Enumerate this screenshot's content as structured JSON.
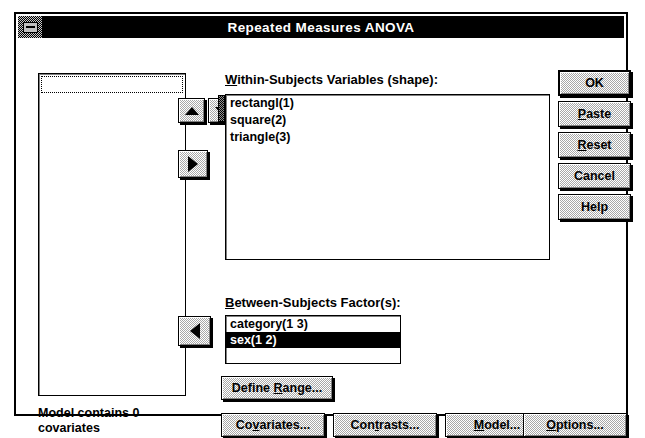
{
  "window": {
    "title": "Repeated Measures ANOVA",
    "sysmenu_icon": "system-menu-icon"
  },
  "source_list": {
    "items": [],
    "focus_row_present": true
  },
  "within_subjects": {
    "label": "Within-Subjects Variables   (shape):",
    "label_prefix": "W",
    "label_rest": "ithin-Subjects Variables   (shape):",
    "items": [
      "rectangl(1)",
      "square(2)",
      "triangle(3)"
    ]
  },
  "between_subjects": {
    "label_prefix": "B",
    "label_rest": "etween-Subjects Factor(s):",
    "items": [
      {
        "text": "category(1 3)",
        "selected": false
      },
      {
        "text": "sex(1 2)",
        "selected": true
      }
    ]
  },
  "transfer_buttons": {
    "up": "up-arrow",
    "down": "down-arrow",
    "move_right": "right-arrow",
    "move_left": "left-arrow"
  },
  "define_range_button": {
    "prefix": "Define ",
    "accel": "R",
    "suffix": "ange..."
  },
  "action_buttons": [
    {
      "name": "ok-button",
      "prefix": "",
      "accel": "",
      "suffix": "OK",
      "default": true
    },
    {
      "name": "paste-button",
      "prefix": "",
      "accel": "P",
      "suffix": "aste",
      "default": false
    },
    {
      "name": "reset-button",
      "prefix": "",
      "accel": "R",
      "suffix": "eset",
      "default": false
    },
    {
      "name": "cancel-button",
      "prefix": "",
      "accel": "",
      "suffix": "Cancel",
      "default": false
    },
    {
      "name": "help-button",
      "prefix": "",
      "accel": "",
      "suffix": "Help",
      "default": false
    }
  ],
  "bottom_buttons": [
    {
      "name": "covariates-button",
      "prefix": "Co",
      "accel": "v",
      "suffix": "ariates..."
    },
    {
      "name": "contrasts-button",
      "prefix": "Con",
      "accel": "t",
      "suffix": "rasts..."
    },
    {
      "name": "model-button",
      "prefix": "",
      "accel": "M",
      "suffix": "odel..."
    },
    {
      "name": "options-button",
      "prefix": "",
      "accel": "O",
      "suffix": "ptions..."
    }
  ],
  "status": {
    "line1": "Model contains 0",
    "line2": "covariates"
  },
  "colors": {
    "window_background": "#ffffff",
    "titlebar_background": "#000000",
    "titlebar_text": "#ffffff",
    "button_face": "#c0c0c0",
    "selection_background": "#000000",
    "selection_text": "#ffffff",
    "border": "#000000"
  }
}
